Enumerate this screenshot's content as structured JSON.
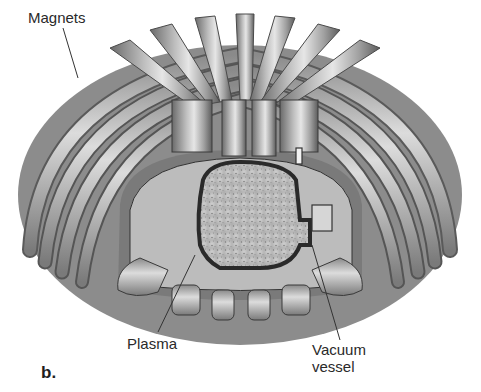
{
  "figure": {
    "panel_label": "b.",
    "colors": {
      "background": "#ffffff",
      "coil_light": "#d8d8d8",
      "coil_mid": "#a6a6a6",
      "coil_dark": "#5a5a5a",
      "plasma": "#c4c4c4",
      "outline": "#2a2a2a"
    },
    "labels": {
      "magnets": "Magnets",
      "plasma": "Plasma",
      "vacuum_vessel_line1": "Vacuum",
      "vacuum_vessel_line2": "vessel"
    }
  }
}
